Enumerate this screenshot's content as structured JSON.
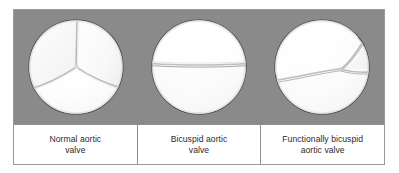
{
  "figure": {
    "background_color": "#8a8a8a",
    "frame_border_color": "#9a9a9a",
    "panel_background": "#ffffff",
    "divider_color": "#8f8f8f",
    "leaflet_fill": "#fbfbfb",
    "leaflet_outline": "#4a4a4a",
    "commissure_line_color": "#b4b4b4",
    "label_text_color": "#2b2b2b"
  },
  "panels": [
    {
      "id": "normal-aortic-valve",
      "label": "Normal aortic\nvalve",
      "diagram_name": "tricuspid-aortic-valve-diagram",
      "cusp_count": 3,
      "commissure_description": "Three commissural lines radiating from the center: one upward, one to the lower-left, one to the lower-right."
    },
    {
      "id": "bicuspid-aortic-valve",
      "label": "Bicuspid aortic\nvalve",
      "diagram_name": "bicuspid-aortic-valve-diagram",
      "cusp_count": 2,
      "commissure_description": "A single nearly horizontal commissural line across the middle of the orifice."
    },
    {
      "id": "functionally-bicuspid-aortic-valve",
      "label": "Functionally bicuspid\naortic valve",
      "diagram_name": "functionally-bicuspid-aortic-valve-diagram",
      "cusp_count": 3,
      "commissure_description": "A diagonal commissural line from lower-left to upper-right with a short fused raphe branching to the right edge, giving a three-cusp valve that functions as two."
    }
  ]
}
